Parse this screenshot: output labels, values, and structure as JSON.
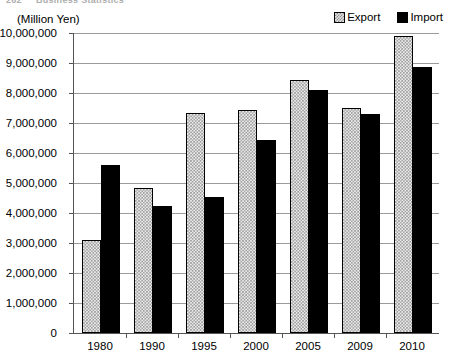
{
  "running_header": {
    "number": "262",
    "title": "Business Statistics"
  },
  "chart_data": {
    "type": "bar",
    "title": "",
    "subtitle": "",
    "unit_label": "(Million Yen)",
    "xlabel": "",
    "ylabel": "(Million Yen)",
    "categories": [
      "1980",
      "1990",
      "1995",
      "2000",
      "2005",
      "2009",
      "2010"
    ],
    "series": [
      {
        "name": "Export",
        "color": "#ececec",
        "pattern": "checkered-light",
        "values": [
          3100000,
          4830000,
          7350000,
          7430000,
          8430000,
          7500000,
          9900000
        ]
      },
      {
        "name": "Import",
        "color": "#000000",
        "pattern": "solid-black",
        "values": [
          5600000,
          4230000,
          4550000,
          6430000,
          8100000,
          7300000,
          8870000
        ]
      }
    ],
    "ylim": [
      0,
      10000000
    ],
    "ytick_step": 1000000,
    "ytick_labels": [
      "10,000,000",
      "9,000,000",
      "8,000,000",
      "7,000,000",
      "6,000,000",
      "5,000,000",
      "4,000,000",
      "3,000,000",
      "2,000,000",
      "1,000,000",
      "0"
    ],
    "ytick_values": [
      10000000,
      9000000,
      8000000,
      7000000,
      6000000,
      5000000,
      4000000,
      3000000,
      2000000,
      1000000,
      0
    ],
    "grid": true,
    "grid_axis": "y",
    "legend": {
      "position": "top-right",
      "entries": [
        "Export",
        "Import"
      ]
    }
  }
}
